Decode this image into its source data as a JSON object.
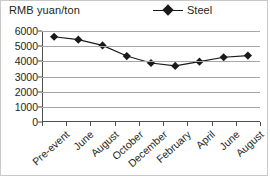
{
  "axis_title": "RMB yuan/ton",
  "legend": {
    "marker_icon": "diamond-marker-icon",
    "entries": [
      {
        "label": "Steel",
        "color": "#1a1a1a"
      }
    ]
  },
  "chart_data": {
    "type": "line",
    "title": "",
    "subtitle": "",
    "xlabel": "",
    "ylabel": "RMB yuan/ton",
    "categories": [
      "Pre-event",
      "June",
      "August",
      "October",
      "December",
      "February",
      "April",
      "June",
      "August"
    ],
    "series": [
      {
        "name": "Steel",
        "color": "#1a1a1a",
        "marker": "diamond",
        "values": [
          5620,
          5430,
          5050,
          4350,
          3890,
          3700,
          3980,
          4270,
          4380
        ]
      }
    ],
    "ylim": [
      0,
      6000
    ],
    "yticks": [
      0,
      1000,
      2000,
      3000,
      4000,
      5000,
      6000
    ],
    "ytick_labels": [
      "0",
      "1000",
      "2000",
      "3000",
      "4000",
      "5000",
      "6000"
    ],
    "grid": true,
    "grid_axis": "y",
    "legend_position": "top-right"
  },
  "colors": {
    "series": "#1a1a1a",
    "grid": "#a6a6a6",
    "axis": "#4d4d4d",
    "text": "#231f20",
    "background": "#ffffff",
    "border": "#c9c9c9"
  }
}
